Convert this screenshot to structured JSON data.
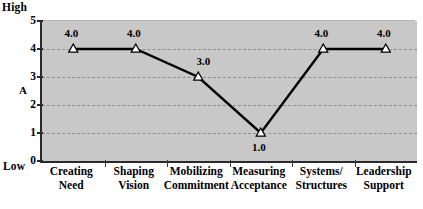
{
  "chart_data": {
    "type": "line",
    "title": "",
    "xlabel": "",
    "ylabel": "A",
    "ylim": [
      0,
      5
    ],
    "yticks": [
      0,
      1,
      2,
      3,
      4,
      5
    ],
    "ytick_labels": [
      "0",
      "1",
      "2",
      "3",
      "4",
      "5"
    ],
    "grid": {
      "horizontal": true,
      "horizontal_at": [
        1,
        2,
        3,
        4
      ],
      "style": "dashed",
      "vertical": false
    },
    "legend": null,
    "plot_background": "#c8c8c8",
    "page_background": "#ffffff",
    "line_color": "#000000",
    "marker": {
      "shape": "triangle-up",
      "fill": "#ffffff",
      "edge": "#000000"
    },
    "axis_anchors": {
      "top": "High",
      "bottom": "Low"
    },
    "categories": [
      {
        "line1": "Creating",
        "line2": "Need"
      },
      {
        "line1": "Shaping",
        "line2": "Vision"
      },
      {
        "line1": "Mobilizing",
        "line2": "Commitment"
      },
      {
        "line1": "Measuring",
        "line2": "Acceptance"
      },
      {
        "line1": "Systems/",
        "line2": "Structures"
      },
      {
        "line1": "Leadership",
        "line2": "Support"
      }
    ],
    "values": [
      4.0,
      4.0,
      3.0,
      1.0,
      4.0,
      4.0
    ],
    "data_labels": [
      "4.0",
      "4.0",
      "3.0",
      "1.0",
      "4.0",
      "4.0"
    ],
    "data_label_positions": [
      "above",
      "above",
      "above-right",
      "below",
      "above",
      "above"
    ]
  }
}
